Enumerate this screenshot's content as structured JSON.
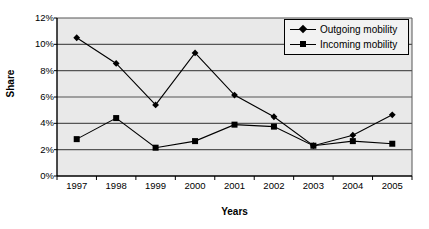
{
  "chart_data": {
    "type": "line",
    "title": "",
    "xlabel": "Years",
    "ylabel": "Share",
    "categories": [
      "1997",
      "1998",
      "1999",
      "2000",
      "2001",
      "2002",
      "2003",
      "2004",
      "2005"
    ],
    "series": [
      {
        "name": "Outgoing mobility",
        "marker": "diamond",
        "color": "#000000",
        "values": [
          10.5,
          8.55,
          5.4,
          9.35,
          6.15,
          4.5,
          2.3,
          3.1,
          4.65
        ]
      },
      {
        "name": "Incoming mobility",
        "marker": "square",
        "color": "#000000",
        "values": [
          2.8,
          4.4,
          2.15,
          2.65,
          3.9,
          3.75,
          2.3,
          2.65,
          2.45
        ]
      }
    ],
    "ylim": [
      0,
      12
    ],
    "ytick_values": [
      0,
      2,
      4,
      6,
      8,
      10,
      12
    ],
    "ytick_labels": [
      "0%",
      "2%",
      "4%",
      "6%",
      "8%",
      "10%",
      "12%"
    ],
    "grid": true,
    "grid_axis": "y",
    "legend_position": "top-right",
    "plot_background": "#e9e9e9",
    "grid_color": "#555555",
    "axis_color": "#000000"
  }
}
